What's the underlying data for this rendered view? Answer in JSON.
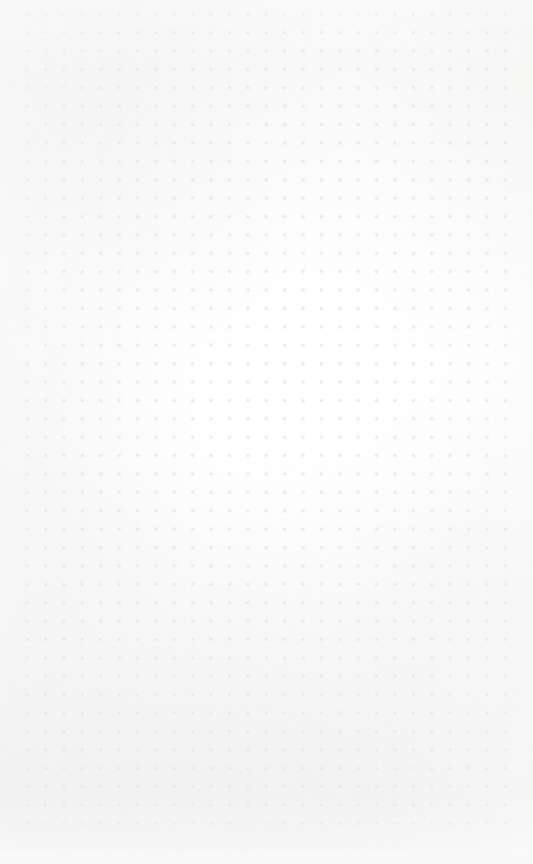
{
  "page": {
    "kind": "dot-grid-notepad-page",
    "width": 533,
    "height": 864,
    "background_color": "#fdfdfd",
    "has_text_content": false,
    "has_ui_controls": false,
    "content_summary": "Empty dotted-grid (bullet journal) paper with no written or printed content"
  },
  "grid": {
    "name": "dot-grid",
    "dot_color": "#e3e3e6",
    "dot_halo_color": "#efeff2",
    "dot_diameter_px": 1.5,
    "pitch_px": 18.4,
    "origin_x_px": 18,
    "origin_y_px": 5,
    "columns": 28,
    "rows": 46,
    "margin_left_px": 18,
    "margin_right_px": 18,
    "margin_top_px": 5,
    "margin_bottom_px": 19
  },
  "texture": {
    "name": "paper-grain",
    "tone_color": "#f7f7f6",
    "highlight_color": "#ffffff",
    "description": "subtle scanned-paper tone variation, lighter at centre"
  }
}
